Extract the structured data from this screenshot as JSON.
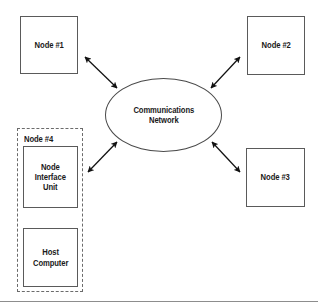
{
  "figure": {
    "type": "network-topology-diagram",
    "background_color": "#ffffff",
    "line_color": "#5a5a5a",
    "text_color": "#1a1a1a",
    "bottom_rule_color": "#8d8d8d"
  },
  "hub": {
    "name": "communications-network",
    "shape": "ellipse",
    "label_line1": "Communications",
    "label_line2": "Network"
  },
  "nodes": [
    {
      "id": "node1",
      "label": "Node #1",
      "shape": "rectangle"
    },
    {
      "id": "node2",
      "label": "Node #2",
      "shape": "rectangle"
    },
    {
      "id": "node3",
      "label": "Node #3",
      "shape": "rectangle"
    }
  ],
  "node4": {
    "group_label": "Node #4",
    "group_border": "dashed",
    "interface_unit": {
      "label_line1": "Node",
      "label_line2": "Interface",
      "label_line3": "Unit"
    },
    "host": {
      "label_line1": "Host",
      "label_line2": "Computer"
    },
    "internal_link": "bidirectional-arrow"
  },
  "connections": [
    {
      "from": "node1",
      "to": "communications-network",
      "style": "double-headed-arrow"
    },
    {
      "from": "node2",
      "to": "communications-network",
      "style": "double-headed-arrow"
    },
    {
      "from": "node3",
      "to": "communications-network",
      "style": "double-headed-arrow"
    },
    {
      "from": "node4",
      "to": "communications-network",
      "style": "double-headed-arrow"
    },
    {
      "from": "node-interface-unit",
      "to": "host-computer",
      "style": "double-headed-arrow"
    }
  ]
}
